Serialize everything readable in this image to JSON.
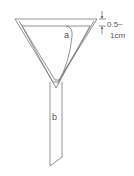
{
  "diagram": {
    "title": "",
    "labels": {
      "filter_paper": "a",
      "stem": "b",
      "dimension_line1": "0.5~",
      "dimension_line2": "1cm"
    },
    "colors": {
      "stroke": "#777777",
      "text": "#555555",
      "background": "#ffffff"
    }
  }
}
